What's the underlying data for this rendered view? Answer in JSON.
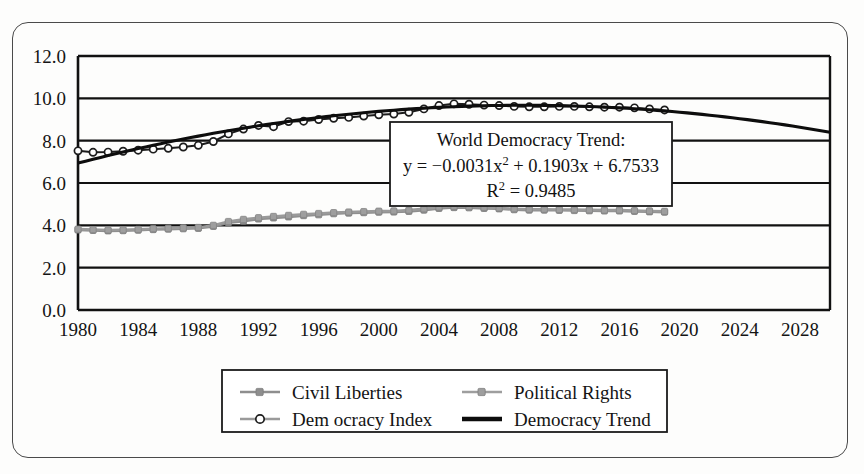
{
  "chart_data": {
    "type": "line",
    "title": "",
    "xlabel": "",
    "ylabel": "",
    "xlim": [
      1980,
      2030
    ],
    "ylim": [
      0.0,
      12.0
    ],
    "grid": true,
    "legend_position": "bottom",
    "xticks": [
      "1980",
      "1984",
      "1988",
      "1992",
      "1996",
      "2000",
      "2004",
      "2008",
      "2012",
      "2016",
      "2020",
      "2024",
      "2028"
    ],
    "yticks": [
      "0.0",
      "2.0",
      "4.0",
      "6.0",
      "8.0",
      "10.0",
      "12.0"
    ],
    "x": [
      1980,
      1981,
      1982,
      1983,
      1984,
      1985,
      1986,
      1987,
      1988,
      1989,
      1990,
      1991,
      1992,
      1993,
      1994,
      1995,
      1996,
      1997,
      1998,
      1999,
      2000,
      2001,
      2002,
      2003,
      2004,
      2005,
      2006,
      2007,
      2008,
      2009,
      2010,
      2011,
      2012,
      2013,
      2014,
      2015,
      2016,
      2017,
      2018,
      2019
    ],
    "series": [
      {
        "name": "Civil Liberties",
        "marker": "square",
        "color": "#8e8e8e",
        "style": "line-marker-light",
        "values": [
          3.78,
          3.76,
          3.74,
          3.75,
          3.77,
          3.8,
          3.82,
          3.84,
          3.86,
          3.95,
          4.12,
          4.2,
          4.3,
          4.35,
          4.4,
          4.46,
          4.5,
          4.55,
          4.58,
          4.6,
          4.62,
          4.63,
          4.66,
          4.72,
          4.8,
          4.84,
          4.83,
          4.8,
          4.78,
          4.74,
          4.72,
          4.72,
          4.71,
          4.7,
          4.69,
          4.68,
          4.68,
          4.66,
          4.64,
          4.62
        ]
      },
      {
        "name": "Political Rights",
        "marker": "square",
        "color": "#9e9e9e",
        "style": "line-marker-mid",
        "values": [
          3.82,
          3.8,
          3.78,
          3.79,
          3.81,
          3.84,
          3.86,
          3.88,
          3.9,
          4.0,
          4.18,
          4.28,
          4.36,
          4.42,
          4.47,
          4.52,
          4.56,
          4.6,
          4.63,
          4.65,
          4.67,
          4.68,
          4.72,
          4.78,
          4.86,
          4.9,
          4.88,
          4.85,
          4.82,
          4.78,
          4.76,
          4.76,
          4.75,
          4.74,
          4.73,
          4.72,
          4.72,
          4.7,
          4.68,
          4.66
        ]
      },
      {
        "name": "Dem ocracy Index",
        "marker": "circle-open",
        "color": "#1c1c1c",
        "style": "line-marker-open",
        "values": [
          7.52,
          7.45,
          7.46,
          7.5,
          7.55,
          7.6,
          7.64,
          7.7,
          7.78,
          7.96,
          8.32,
          8.55,
          8.72,
          8.66,
          8.9,
          8.92,
          9.0,
          9.06,
          9.1,
          9.16,
          9.22,
          9.26,
          9.34,
          9.5,
          9.66,
          9.74,
          9.72,
          9.68,
          9.66,
          9.62,
          9.6,
          9.6,
          9.62,
          9.62,
          9.6,
          9.58,
          9.58,
          9.55,
          9.5,
          9.45
        ]
      }
    ],
    "trend": {
      "name": "Democracy Trend",
      "equation_title": "World Democracy Trend:",
      "equation": "y = −0.0031x² + 0.1903x + 6.7533",
      "equation_prefix": "y = −0.0031x",
      "equation_suffix": "+ 0.1903x + 6.7533",
      "r_squared_label": "R² = 0.9485",
      "r_squared_value": 0.9485,
      "coefficients": {
        "a": -0.0031,
        "b": 0.1903,
        "c": 6.7533
      },
      "x_origin": 1980,
      "color": "#0d0d0d",
      "x_start": 1980,
      "x_end": 2030,
      "y_start": 6.75,
      "y_end": 8.32
    },
    "legend": [
      {
        "label": "Civil Liberties",
        "style": "line-marker-light"
      },
      {
        "label": "Political Rights",
        "style": "line-marker-mid"
      },
      {
        "label": "Dem ocracy Index",
        "style": "line-marker-open"
      },
      {
        "label": "Democracy Trend",
        "style": "line-thick-dark"
      }
    ]
  },
  "colors": {
    "axis": "#111111",
    "grid": "#111111",
    "frame": "#4a4a4a",
    "trend": "#0d0d0d",
    "civil_liberties": "#8e8e8e",
    "political_rights": "#9e9e9e",
    "democracy_index": "#1c1c1c",
    "background": "#fdfdfc"
  }
}
